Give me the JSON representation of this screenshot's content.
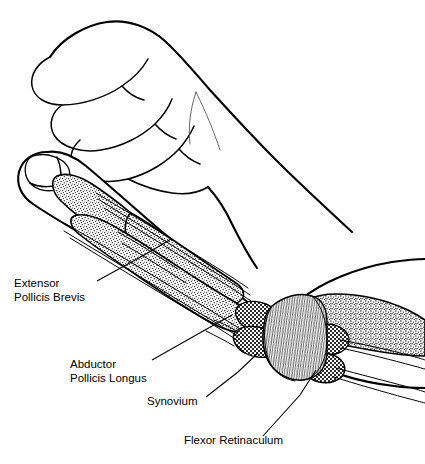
{
  "figure": {
    "background_color": "#ffffff",
    "ink_color": "#000000",
    "width": 425,
    "height": 464,
    "view": "lateral (radial) view of a hand with flexed fingers, thumb extended, showing dissected tendon sheaths at the wrist"
  },
  "labels": [
    {
      "id": "extensor-pollicis-brevis",
      "line1": "Extensor",
      "line2": "Pollicis Brevis",
      "text_x": 14,
      "text_y": 287,
      "leader": "M 97 281 L 146 254 L 171 239"
    },
    {
      "id": "abductor-pollicis-longus",
      "line1": "Abductor",
      "line2": "Pollicis Longus",
      "text_x": 70,
      "text_y": 368,
      "leader": "M 152 360 L 205 330 L 232 315"
    },
    {
      "id": "synovium",
      "line1": "Synovium",
      "line2": "",
      "text_x": 147,
      "text_y": 405,
      "leader": "M 206 397 L 238 372 L 258 353"
    },
    {
      "id": "flexor-retinaculum",
      "line1": "Flexor Retinaculum",
      "line2": "",
      "text_x": 184,
      "text_y": 444,
      "leader": "M 263 436 L 300 395 L 316 370"
    }
  ],
  "structures": {
    "hand": "hand-outline",
    "thumb": "thumb-outline",
    "nail": "thumbnail",
    "bones": "stippled-bone-segments",
    "tendons": "tendon-strands",
    "sheaths": "tendon-sheath-segments",
    "retinaculum": "flexor-retinaculum-band",
    "forearm": "forearm-outline"
  },
  "textures": {
    "bone_fill": "stipple (fine random dots)",
    "sheath_fill": "halftone checkerboard (mid gray)",
    "retinaculum_fill": "fine vertical fibrous striations"
  }
}
